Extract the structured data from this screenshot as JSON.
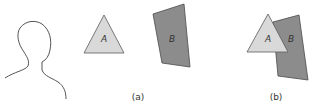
{
  "figure": {
    "shapes": {
      "triangle_label": "A",
      "quad_label": "B"
    },
    "captions": {
      "panel_a": "(a)",
      "panel_b": "(b)"
    },
    "colors": {
      "triangle_fill": "#d9d9d9",
      "quad_fill": "#8c8c8c",
      "stroke": "#4a4a4a"
    }
  }
}
